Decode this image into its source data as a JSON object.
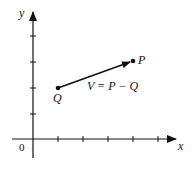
{
  "diagram": {
    "type": "vector-on-axes",
    "axes": {
      "x_label": "x",
      "y_label": "y",
      "origin_label": "0",
      "x_ticks": 5,
      "y_ticks": 4
    },
    "points": [
      {
        "name": "Q",
        "label": "Q",
        "grid": [
          1,
          2
        ]
      },
      {
        "name": "P",
        "label": "P",
        "grid": [
          4,
          3
        ]
      }
    ],
    "vector": {
      "from": "Q",
      "to": "P",
      "label": "V = P − Q"
    },
    "colors": {
      "stroke": "#111111",
      "background": "#ffffff"
    }
  }
}
